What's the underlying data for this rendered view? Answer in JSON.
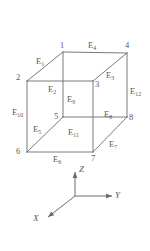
{
  "figure": {
    "name": "hexahedral-element-node-edge-numbering",
    "shape": "cube",
    "vertices": [
      {
        "id": "v1",
        "label": "1",
        "x": 63,
        "y": 52,
        "label_x": 60,
        "label_y": 41
      },
      {
        "id": "v2",
        "label": "2",
        "x": 27,
        "y": 81,
        "label_x": 16,
        "label_y": 73
      },
      {
        "id": "v3",
        "label": "3",
        "x": 93,
        "y": 81,
        "label_x": 95,
        "label_y": 80
      },
      {
        "id": "v4",
        "label": "4",
        "x": 127,
        "y": 53,
        "label_x": 125,
        "label_y": 41
      },
      {
        "id": "v5",
        "label": "5",
        "x": 63,
        "y": 117,
        "label_x": 54,
        "label_y": 112
      },
      {
        "id": "v6",
        "label": "6",
        "x": 27,
        "y": 152,
        "label_x": 16,
        "label_y": 147
      },
      {
        "id": "v7",
        "label": "7",
        "x": 93,
        "y": 152,
        "label_x": 91,
        "label_y": 154
      },
      {
        "id": "v8",
        "label": "8",
        "x": 127,
        "y": 117,
        "label_x": 129,
        "label_y": 113
      }
    ],
    "edges": [
      {
        "id": "E1",
        "label": "E",
        "sub": "1",
        "from": "v2",
        "to": "v1",
        "label_x": 36,
        "label_y": 57
      },
      {
        "id": "E2",
        "label": "E",
        "sub": "2",
        "from": "v2",
        "to": "v3",
        "label_x": 48,
        "label_y": 85
      },
      {
        "id": "E3",
        "label": "E",
        "sub": "3",
        "from": "v3",
        "to": "v4",
        "label_x": 106,
        "label_y": 71
      },
      {
        "id": "E4",
        "label": "E",
        "sub": "4",
        "from": "v1",
        "to": "v4",
        "label_x": 88,
        "label_y": 41
      },
      {
        "id": "E5",
        "label": "E",
        "sub": "5",
        "from": "v6",
        "to": "v5",
        "label_x": 33,
        "label_y": 125
      },
      {
        "id": "E6",
        "label": "E",
        "sub": "6",
        "from": "v6",
        "to": "v7",
        "label_x": 53,
        "label_y": 155
      },
      {
        "id": "E7",
        "label": "E",
        "sub": "7",
        "from": "v7",
        "to": "v8",
        "label_x": 109,
        "label_y": 140
      },
      {
        "id": "E8",
        "label": "E",
        "sub": "8",
        "from": "v5",
        "to": "v8",
        "label_x": 104,
        "label_y": 110
      },
      {
        "id": "E9",
        "label": "E",
        "sub": "9",
        "from": "v1",
        "to": "v5",
        "label_x": 67,
        "label_y": 95
      },
      {
        "id": "E10",
        "label": "E",
        "sub": "10",
        "from": "v2",
        "to": "v6",
        "label_x": 12,
        "label_y": 108
      },
      {
        "id": "E11",
        "label": "E",
        "sub": "11",
        "from": "v3",
        "to": "v7",
        "label_x": 68,
        "label_y": 128
      },
      {
        "id": "E12",
        "label": "E",
        "sub": "12",
        "from": "v4",
        "to": "v8",
        "label_x": 130,
        "label_y": 87
      }
    ],
    "axes": {
      "origin_x": 75,
      "origin_y": 196,
      "items": [
        {
          "id": "axis-z",
          "label": "Z",
          "dir": "up",
          "tip_x": 75,
          "tip_y": 172,
          "label_x": 79,
          "label_y": 165
        },
        {
          "id": "axis-y",
          "label": "Y",
          "dir": "right",
          "tip_x": 112,
          "tip_y": 196,
          "label_x": 115,
          "label_y": 191
        },
        {
          "id": "axis-x",
          "label": "X",
          "dir": "down-left",
          "tip_x": 48,
          "tip_y": 217,
          "label_x": 33,
          "label_y": 214
        }
      ]
    }
  }
}
